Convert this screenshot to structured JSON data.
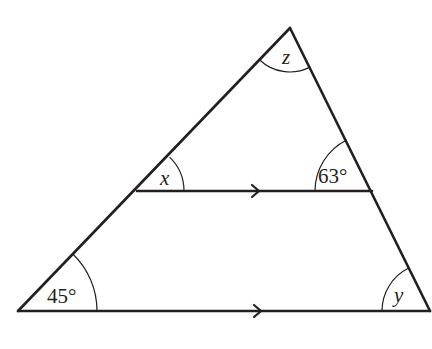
{
  "diagram": {
    "type": "triangle-with-parallel-line",
    "stroke_color": "#231f20",
    "background": "#ffffff",
    "vertices": {
      "apex": [
        290,
        28
      ],
      "bottom_left": [
        18,
        311
      ],
      "bottom_right": [
        430,
        311
      ],
      "mid_left": [
        137,
        191
      ],
      "mid_right": [
        372,
        191
      ]
    },
    "parallel_marks": {
      "middle_line_arrow_x": 258,
      "base_line_arrow_x": 260
    },
    "angles": {
      "apex": {
        "label": "z",
        "is_variable": true
      },
      "mid_left": {
        "label": "x",
        "is_variable": true
      },
      "mid_right": {
        "label": "63°",
        "is_variable": false
      },
      "bottom_left": {
        "label": "45°",
        "is_variable": false
      },
      "bottom_right": {
        "label": "y",
        "is_variable": true
      }
    }
  }
}
